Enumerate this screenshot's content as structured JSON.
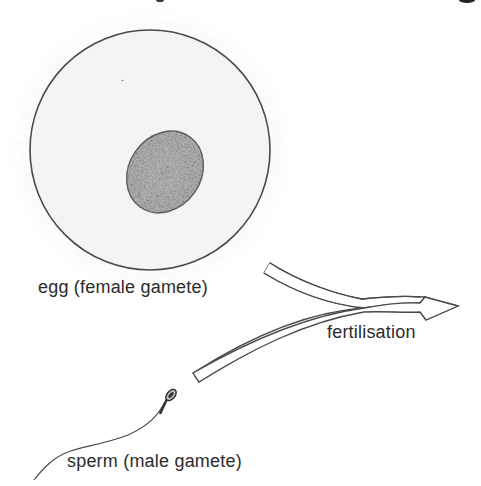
{
  "diagram": {
    "labels": {
      "egg": "egg (female gamete)",
      "fertilisation": "fertilisation",
      "sperm": "sperm (male gamete)"
    },
    "colors": {
      "background": "#ffffff",
      "outline": "#4a4a4a",
      "cytoplasm": "#f4f4f4",
      "halo": "#dcdcdc",
      "nucleus": "#3a3a3a",
      "text": "#2c2c2c"
    },
    "parts": [
      {
        "id": "egg-cell",
        "name": "egg (female gamete)"
      },
      {
        "id": "egg-nucleus",
        "name": "nucleus"
      },
      {
        "id": "sperm-cell",
        "name": "sperm (male gamete)"
      },
      {
        "id": "fertilisation-arrow",
        "name": "fertilisation"
      }
    ]
  }
}
